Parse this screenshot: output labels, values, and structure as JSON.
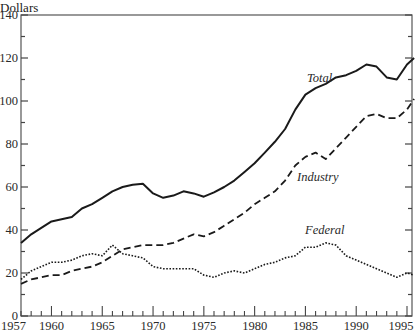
{
  "chart_data": {
    "type": "line",
    "title": "",
    "xlabel": "",
    "ylabel": "Dollars",
    "xlim": [
      1957,
      1995.7
    ],
    "ylim": [
      0,
      140
    ],
    "grid": false,
    "legend": "inline labels",
    "x_ticks": [
      1957,
      1960,
      1965,
      1970,
      1975,
      1980,
      1985,
      1990,
      1995
    ],
    "y_ticks": [
      0,
      20,
      40,
      60,
      80,
      100,
      120,
      140
    ],
    "x": [
      1957,
      1958,
      1959,
      1960,
      1961,
      1962,
      1963,
      1964,
      1965,
      1966,
      1967,
      1968,
      1969,
      1970,
      1971,
      1972,
      1973,
      1974,
      1975,
      1976,
      1977,
      1978,
      1979,
      1980,
      1981,
      1982,
      1983,
      1984,
      1985,
      1986,
      1987,
      1988,
      1989,
      1990,
      1991,
      1992,
      1993,
      1994,
      1995,
      1995.7
    ],
    "series": [
      {
        "name": "Total",
        "style": "solid",
        "values": [
          34,
          38,
          41,
          44,
          45,
          46,
          50,
          52,
          55,
          58,
          60,
          61,
          61.5,
          57,
          55,
          56,
          58,
          57,
          55.5,
          57.5,
          60,
          63,
          67,
          71,
          76,
          81,
          87,
          96,
          103,
          106,
          108,
          111,
          112,
          114,
          117,
          116,
          111,
          110,
          117,
          120
        ]
      },
      {
        "name": "Industry",
        "style": "dashed",
        "values": [
          15,
          17,
          18,
          19,
          19,
          21,
          22,
          23,
          25,
          28,
          31,
          32,
          33,
          33,
          33,
          34,
          36,
          38,
          37,
          39,
          42,
          45,
          48,
          52,
          55,
          58,
          63,
          70,
          74,
          76,
          73,
          78,
          83,
          88,
          93,
          94,
          92,
          92,
          96,
          101
        ]
      },
      {
        "name": "Federal",
        "style": "dotted",
        "values": [
          17,
          21,
          23,
          25,
          25,
          26,
          28,
          29,
          28,
          33,
          29,
          28,
          27,
          23,
          22,
          22,
          22,
          22,
          19,
          18,
          20,
          21,
          20,
          22,
          24,
          25,
          27,
          28,
          32,
          32,
          34,
          33,
          28,
          26,
          24,
          22,
          20,
          18,
          20,
          19
        ]
      }
    ],
    "annotations": [
      {
        "text": "Total",
        "x": 1984.2,
        "y": 106
      },
      {
        "text": "Industry",
        "x": 1985.3,
        "y": 80
      },
      {
        "text": "Federal",
        "x": 1985.7,
        "y": 38
      }
    ]
  },
  "axis": {
    "ylabel": "Dollars",
    "x_tick_labels": [
      "1957",
      "1960",
      "1965",
      "1970",
      "1975",
      "1980",
      "1985",
      "1990",
      "1995"
    ],
    "y_tick_labels": [
      "0",
      "20",
      "40",
      "60",
      "80",
      "100",
      "120",
      "140"
    ]
  },
  "labels": {
    "total": "Total",
    "industry": "Industry",
    "federal": "Federal"
  }
}
